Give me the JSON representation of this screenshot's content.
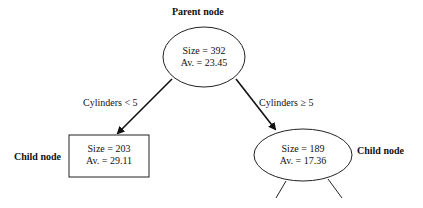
{
  "diagram": {
    "parent": {
      "title": "Parent node",
      "size": "Size = 392",
      "avg": "Av. = 23.45"
    },
    "left_child": {
      "title": "Child node",
      "size": "Size = 203",
      "avg": "Av. = 29.11"
    },
    "right_child": {
      "title": "Child node",
      "size": "Size = 189",
      "avg": "Av. = 17.36"
    },
    "edges": {
      "left": "Cylinders < 5",
      "right": "Cylinders ≥ 5"
    }
  }
}
